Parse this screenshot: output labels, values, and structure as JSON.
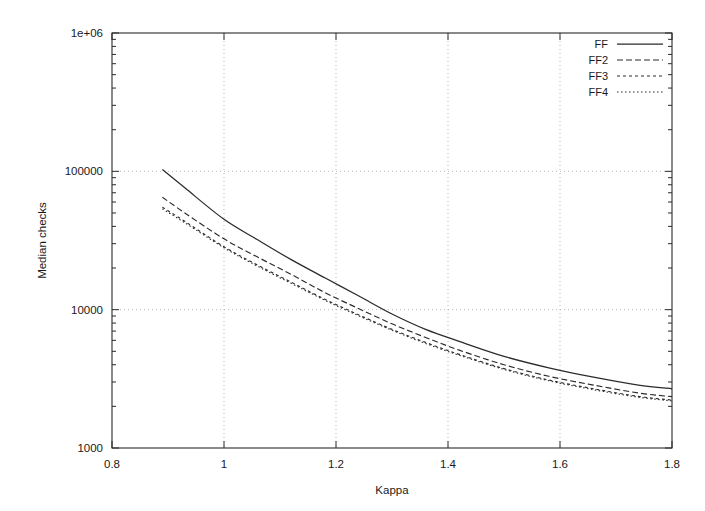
{
  "chart_data": {
    "type": "line",
    "title": "",
    "xlabel": "Kappa",
    "ylabel": "Median checks",
    "xlim": [
      0.8,
      1.8
    ],
    "ylim": [
      1000,
      1000000
    ],
    "yscale": "log",
    "xscale": "linear",
    "grid": true,
    "xticks": [
      0.8,
      1.0,
      1.2,
      1.4,
      1.6,
      1.8
    ],
    "xtick_labels": [
      "0.8",
      "1",
      "1.2",
      "1.4",
      "1.6",
      "1.8"
    ],
    "yticks": [
      1000,
      10000,
      100000,
      1000000
    ],
    "ytick_labels": [
      "1000",
      "10000",
      "100000",
      "1e+06"
    ],
    "legend_position": "top-right",
    "series": [
      {
        "name": "FF",
        "style": "solid",
        "x": [
          0.89,
          0.93,
          1.0,
          1.06,
          1.12,
          1.18,
          1.24,
          1.3,
          1.36,
          1.42,
          1.5,
          1.58,
          1.66,
          1.74,
          1.8
        ],
        "values": [
          103000,
          76000,
          45000,
          32000,
          23000,
          17000,
          12600,
          9300,
          7200,
          5900,
          4600,
          3800,
          3250,
          2850,
          2680
        ]
      },
      {
        "name": "FF2",
        "style": "dashed",
        "x": [
          0.89,
          0.93,
          1.0,
          1.06,
          1.12,
          1.18,
          1.24,
          1.3,
          1.36,
          1.42,
          1.5,
          1.58,
          1.66,
          1.74,
          1.8
        ],
        "values": [
          65000,
          50000,
          32500,
          24000,
          18000,
          13300,
          10200,
          7900,
          6300,
          5100,
          4000,
          3300,
          2850,
          2500,
          2350
        ]
      },
      {
        "name": "FF3",
        "style": "dotted",
        "x": [
          0.89,
          0.93,
          1.0,
          1.06,
          1.12,
          1.18,
          1.24,
          1.3,
          1.36,
          1.42,
          1.5,
          1.58,
          1.66,
          1.74,
          1.8
        ],
        "values": [
          55000,
          43500,
          28500,
          21000,
          15800,
          11900,
          9200,
          7200,
          5800,
          4750,
          3750,
          3100,
          2680,
          2360,
          2220
        ]
      },
      {
        "name": "FF4",
        "style": "fine-dotted",
        "x": [
          0.89,
          0.93,
          1.0,
          1.06,
          1.12,
          1.18,
          1.24,
          1.3,
          1.36,
          1.42,
          1.5,
          1.58,
          1.66,
          1.74,
          1.8
        ],
        "values": [
          53500,
          42500,
          28000,
          20600,
          15500,
          11700,
          9050,
          7100,
          5700,
          4680,
          3700,
          3060,
          2640,
          2330,
          2190
        ]
      }
    ]
  },
  "legend": {
    "entries": [
      {
        "label": "FF"
      },
      {
        "label": "FF2"
      },
      {
        "label": "FF3"
      },
      {
        "label": "FF4"
      }
    ]
  },
  "axes": {
    "x_title": "Kappa",
    "y_title": "Median checks"
  },
  "colors": {
    "line": "#2b2b2b",
    "grid": "#9a9a9a",
    "background": "#ffffff",
    "text": "#1a1a1a"
  }
}
